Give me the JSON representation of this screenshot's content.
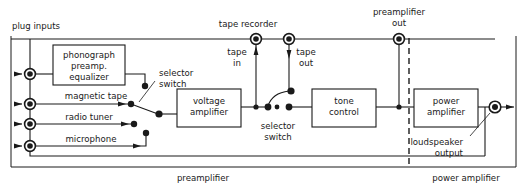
{
  "diagram": {
    "title_labels": {
      "plug_inputs": "plug inputs",
      "tape_recorder": "tape recorder",
      "preamplifier_out": "preamplifier\nout",
      "preamplifier_out_l1": "preamplifier",
      "preamplifier_out_l2": "out"
    },
    "blocks": [
      {
        "id": "phono",
        "line1": "phonograph",
        "line2": "preamp.",
        "line3": "equalizer",
        "x": 53,
        "y": 45,
        "w": 72,
        "h": 40
      },
      {
        "id": "voltage-amplifier",
        "line1": "voltage",
        "line2": "amplifier",
        "x": 177,
        "y": 89,
        "w": 64,
        "h": 38
      },
      {
        "id": "tone-control",
        "line1": "tone",
        "line2": "control",
        "x": 312,
        "y": 89,
        "w": 64,
        "h": 38
      },
      {
        "id": "power-amplifier",
        "line1": "power",
        "line2": "amplifier",
        "x": 414,
        "y": 89,
        "w": 64,
        "h": 38
      }
    ],
    "input_labels": [
      {
        "id": "magnetic-tape",
        "text": "magnetic tape",
        "x": 95,
        "y": 96
      },
      {
        "id": "radio-tuner",
        "text": "radio tuner",
        "x": 88,
        "y": 118
      },
      {
        "id": "microphone",
        "text": "microphone",
        "x": 90,
        "y": 140
      }
    ],
    "switch_labels": [
      {
        "id": "input-selector",
        "line1": "selector",
        "line2": "switch",
        "x": 157,
        "y": 72
      },
      {
        "id": "tape-selector",
        "line1": "selector",
        "line2": "switch",
        "x": 262,
        "y": 119
      }
    ],
    "tape_labels": [
      {
        "id": "tape-in",
        "line1": "tape",
        "line2": "in",
        "x": 234,
        "y": 52
      },
      {
        "id": "tape-out",
        "line1": "tape",
        "line2": "out",
        "x": 296,
        "y": 52
      }
    ],
    "output_label": {
      "id": "loudspeaker-output",
      "line1": "loudspeaker",
      "line2": "output",
      "x": 418,
      "y": 141
    },
    "section_labels": [
      {
        "id": "preamplifier-section",
        "text": "preamplifier",
        "x": 173,
        "y": 178
      },
      {
        "id": "power-amplifier-section",
        "text": "power amplifier",
        "x": 420,
        "y": 178
      }
    ],
    "terminals": [
      {
        "id": "phono-input",
        "x": 30,
        "y": 74
      },
      {
        "id": "magnetic-tape-input",
        "x": 30,
        "y": 104
      },
      {
        "id": "radio-tuner-input",
        "x": 30,
        "y": 124
      },
      {
        "id": "microphone-input",
        "x": 30,
        "y": 146
      },
      {
        "id": "tape-in-terminal",
        "x": 256,
        "y": 39
      },
      {
        "id": "tape-out-terminal",
        "x": 289,
        "y": 39
      },
      {
        "id": "preamplifier-out-terminal",
        "x": 399,
        "y": 39
      },
      {
        "id": "loudspeaker-output-terminal",
        "x": 495,
        "y": 107
      }
    ],
    "colors": {
      "ink": "#1a1a1a",
      "background": "#ffffff"
    }
  }
}
